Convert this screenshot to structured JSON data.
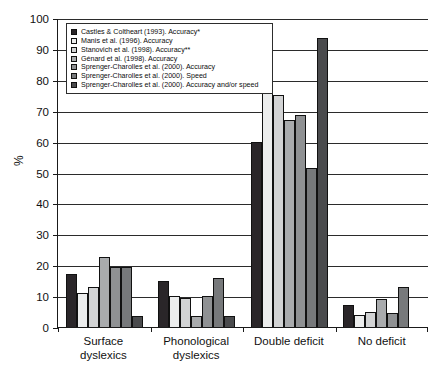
{
  "chart_data": {
    "type": "bar",
    "title": "",
    "subtitle": "",
    "xlabel": "",
    "ylabel": "%",
    "ylim": [
      0,
      100
    ],
    "ytick_step": 10,
    "yticks": [
      0,
      10,
      20,
      30,
      40,
      50,
      60,
      70,
      80,
      90,
      100
    ],
    "grid": true,
    "legend_position": "upper-left-inside-box",
    "orientation": "vertical",
    "grouping": "clustered",
    "categories": [
      "Surface dyslexics",
      "Phonological dyslexics",
      "Double deficit",
      "No deficit"
    ],
    "category_lines": [
      [
        "Surface",
        "dyslexics"
      ],
      [
        "Phonological",
        "dyslexics"
      ],
      [
        "Double deficit"
      ],
      [
        "No deficit"
      ]
    ],
    "series": [
      {
        "name": "Castles & Coltheart (1993). Accuracy*",
        "color": "#2a2629",
        "values": [
          17,
          15,
          60,
          7
        ]
      },
      {
        "name": "Manis et al. (1996). Accuracy",
        "color": "#eceded",
        "values": [
          11,
          10,
          76,
          4
        ]
      },
      {
        "name": "Stanovich et al. (1998). Accuracy**",
        "color": "#d2d3d4",
        "values": [
          13,
          9.5,
          75,
          5
        ]
      },
      {
        "name": "Génard et al. (1998). Accuracy",
        "color": "#a9abad",
        "values": [
          22.5,
          3.5,
          67,
          9
        ]
      },
      {
        "name": "Sprenger-Charolles et al. (2000). Accuracy",
        "color": "#8f9193",
        "values": [
          19.5,
          10,
          68.5,
          4.5
        ]
      },
      {
        "name": "Sprenger-Charolles et al. (2000). Speed",
        "color": "#77797b",
        "values": [
          19.5,
          16,
          51.5,
          13
        ]
      },
      {
        "name": "Sprenger-Charolles et al. (2000). Accuracy and/or speed",
        "color": "#4a4b4d",
        "values": [
          3.5,
          3.5,
          93.5,
          0
        ]
      }
    ]
  }
}
